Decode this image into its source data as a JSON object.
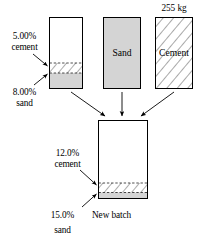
{
  "figure": {
    "type": "mixture-flow-diagram",
    "width": 207,
    "height": 246,
    "background": "#ffffff",
    "stroke_color": "#000000",
    "fill_gray": "#d4d4d4",
    "fill_white": "#ffffff",
    "hatch_color": "#555555"
  },
  "sources": {
    "original_batch": {
      "name": "original-batch-container",
      "cement_label_line1": "5.00%",
      "cement_label_line2": "cement",
      "sand_label_line1": "8.00%",
      "sand_label_line2": "sand",
      "cement_percent": 5.0,
      "sand_percent": 8.0,
      "fill_top": "white",
      "band_cement": "hatched",
      "band_sand": "gray"
    },
    "sand": {
      "name": "sand-container",
      "label": "Sand",
      "fill": "gray"
    },
    "cement": {
      "name": "cement-container",
      "label": "Cement",
      "mass_label": "255 kg",
      "mass_value": 255,
      "mass_unit": "kg",
      "fill": "hatched"
    }
  },
  "result": {
    "new_batch": {
      "name": "new-batch-container",
      "label": "New batch",
      "cement_label_line1": "12.0%",
      "cement_label_line2": "cement",
      "sand_label_line1": "15.0%",
      "sand_label_line2": "sand",
      "cement_percent": 12.0,
      "sand_percent": 15.0,
      "fill_top": "white",
      "band_cement": "hatched",
      "band_sand": "gray"
    }
  },
  "arrows": [
    {
      "name": "arrow-original-to-new",
      "from": "original-batch-container",
      "to": "new-batch-container",
      "direction": "diagonal-down-right"
    },
    {
      "name": "arrow-sand-to-new",
      "from": "sand-container",
      "to": "new-batch-container",
      "direction": "down"
    },
    {
      "name": "arrow-cement-to-new",
      "from": "cement-container",
      "to": "new-batch-container",
      "direction": "diagonal-down-left"
    }
  ],
  "leaders": [
    {
      "name": "leader-original-cement",
      "target": "original-cement-band"
    },
    {
      "name": "leader-original-sand",
      "target": "original-sand-band"
    },
    {
      "name": "leader-new-cement",
      "target": "new-cement-band"
    },
    {
      "name": "leader-new-sand",
      "target": "new-sand-band"
    }
  ]
}
